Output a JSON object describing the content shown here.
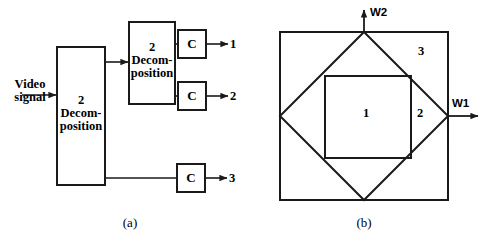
{
  "figure": {
    "panels": [
      {
        "id": "a",
        "caption": "(a)",
        "input_label": "Video\nsignal",
        "blocks": [
          {
            "name": "decomposition-block-1",
            "text": "2\nDecom-\nposition"
          },
          {
            "name": "decomposition-block-2",
            "text": "2\nDecom-\nposition"
          }
        ],
        "coder_label": "C",
        "coders": [
          {
            "name": "coder-1",
            "label": "C",
            "output": "1"
          },
          {
            "name": "coder-2",
            "label": "C",
            "output": "2"
          },
          {
            "name": "coder-3",
            "label": "C",
            "output": "3"
          }
        ],
        "outputs": [
          "1",
          "2",
          "3"
        ]
      },
      {
        "id": "b",
        "caption": "(b)",
        "axes": [
          {
            "name": "frequency-axis-w1",
            "label": "W1"
          },
          {
            "name": "frequency-axis-w2",
            "label": "W2"
          }
        ],
        "regions": [
          {
            "name": "region-1",
            "label": "1"
          },
          {
            "name": "region-2",
            "label": "2"
          },
          {
            "name": "region-3",
            "label": "3"
          }
        ]
      }
    ]
  },
  "colors": {
    "stroke": "#1a1a1a",
    "background": "#ffffff"
  }
}
